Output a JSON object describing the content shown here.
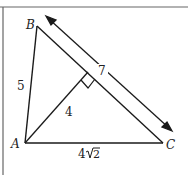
{
  "figure": {
    "vertices": {
      "A": "A",
      "B": "B",
      "C": "C"
    },
    "lengths": {
      "AB": "5",
      "BC": "7",
      "altitude": "4",
      "AC_root": "4",
      "AC_rad": "2"
    },
    "ink_color": "#1a1a1a",
    "border_color": "#555555"
  }
}
